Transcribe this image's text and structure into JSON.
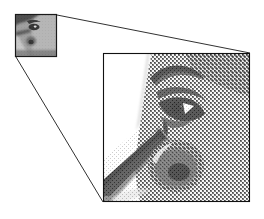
{
  "figure": {
    "type": "magnification-callout",
    "title": "",
    "background_color": "#ffffff",
    "line_color": "#1a1a1a",
    "width": 264,
    "height": 219
  },
  "thumbnail": {
    "label": "source-image-thumbnail",
    "caption": "",
    "subject": "grayscale face profile",
    "x": 15,
    "y": 14,
    "width": 42,
    "height": 43,
    "border_color": "#1a1a1a",
    "tone_light": "#bdbdbd",
    "tone_mid": "#8a8a8a",
    "tone_dark": "#2b2b2b"
  },
  "magnified_panel": {
    "label": "magnified-detail-panel",
    "caption": "",
    "subject": "halftone dithered eye and nose detail",
    "x": 103,
    "y": 53,
    "width": 147,
    "height": 149,
    "border_color": "#111111",
    "render_mode": "halftone-dither",
    "tone_white": "#ffffff",
    "tone_light": "#d6d6d6",
    "tone_mid": "#8f8f8f",
    "tone_dark": "#3a3a3a",
    "tone_black": "#0d0d0d"
  },
  "connectors": [
    {
      "label": "upper-callout-line",
      "from_x": 57,
      "from_y": 15,
      "to_x": 250,
      "to_y": 53
    },
    {
      "label": "lower-callout-line",
      "from_x": 16,
      "from_y": 57,
      "to_x": 103,
      "to_y": 202
    }
  ]
}
